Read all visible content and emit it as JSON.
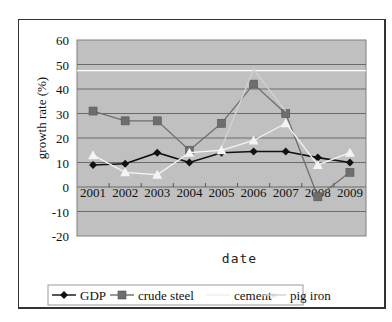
{
  "chart_data": {
    "type": "line",
    "title": "",
    "xlabel": "date",
    "ylabel": "growth rate (%)",
    "ylim": [
      -20,
      60
    ],
    "yticks": [
      60,
      50,
      40,
      30,
      20,
      10,
      0,
      -10,
      -20
    ],
    "categories": [
      "2001",
      "2002",
      "2003",
      "2004",
      "2005",
      "2006",
      "2007",
      "2008",
      "2009"
    ],
    "grid": true,
    "legend_position": "bottom",
    "series": [
      {
        "name": "GDP",
        "marker": "diamond",
        "color": "#111111",
        "values": [
          9,
          9.5,
          14,
          10,
          14,
          14.5,
          14.5,
          12,
          10
        ]
      },
      {
        "name": "crude steel",
        "marker": "square",
        "color": "#6e6e6e",
        "values": [
          31,
          27,
          27,
          15,
          26,
          42,
          30,
          -4,
          6
        ]
      },
      {
        "name": "cement",
        "marker": "none",
        "color": "#d2d2d2",
        "values": [
          null,
          null,
          null,
          null,
          16,
          48,
          31,
          null,
          null
        ]
      },
      {
        "name": "pig iron",
        "marker": "triangle",
        "color": "#f4f4f4",
        "values": [
          13,
          6,
          5,
          14,
          15,
          19,
          26,
          9,
          14
        ]
      }
    ],
    "annotations": [
      {
        "type": "hline",
        "y": 47.5,
        "color": "#ffffff"
      }
    ]
  },
  "legend": {
    "items": [
      "GDP",
      "crude steel",
      "cement",
      "pig iron"
    ]
  }
}
